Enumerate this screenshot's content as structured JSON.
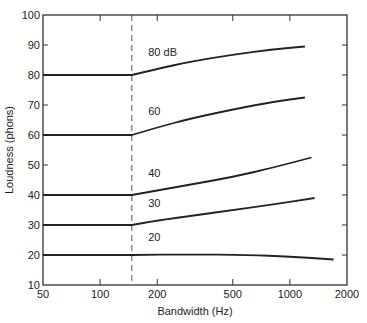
{
  "chart_data": {
    "type": "line",
    "title": "",
    "xlabel": "Bandwidth (Hz)",
    "ylabel": "Loudness (phons)",
    "xscale": "log",
    "xlim": [
      50,
      2000
    ],
    "ylim": [
      10,
      100
    ],
    "xticks": [
      50,
      100,
      200,
      500,
      1000,
      2000
    ],
    "xtick_labels": [
      "50",
      "100",
      "200",
      "500",
      "1000",
      "2000"
    ],
    "yticks": [
      10,
      20,
      30,
      40,
      50,
      60,
      70,
      80,
      90,
      100
    ],
    "ytick_labels": [
      "10",
      "20",
      "30",
      "40",
      "50",
      "60",
      "70",
      "80",
      "90",
      "100"
    ],
    "grid": false,
    "annotations": [
      {
        "type": "vline",
        "x": 160,
        "style": "dashed",
        "meaning": "critical bandwidth"
      }
    ],
    "series": [
      {
        "name": "80 dB",
        "label": "80 dB",
        "x": [
          50,
          160,
          200,
          300,
          500,
          800,
          1200
        ],
        "y": [
          80,
          80,
          82,
          84.5,
          86.8,
          88.5,
          89.5
        ]
      },
      {
        "name": "60 dB",
        "label": "60",
        "x": [
          50,
          160,
          200,
          300,
          500,
          800,
          1200
        ],
        "y": [
          60,
          60,
          62.5,
          65.5,
          68.5,
          71,
          72.5
        ]
      },
      {
        "name": "40 dB",
        "label": "40",
        "x": [
          50,
          160,
          200,
          300,
          500,
          800,
          1300
        ],
        "y": [
          40,
          40,
          41.5,
          43.5,
          46,
          49,
          52.5
        ]
      },
      {
        "name": "30 dB",
        "label": "30",
        "x": [
          50,
          160,
          200,
          300,
          500,
          800,
          1350
        ],
        "y": [
          30,
          30,
          31.5,
          33,
          35,
          36.8,
          39
        ]
      },
      {
        "name": "20 dB",
        "label": "20",
        "x": [
          50,
          160,
          300,
          600,
          1000,
          1700
        ],
        "y": [
          20,
          20,
          20.2,
          20,
          19.5,
          18.5
        ]
      }
    ]
  }
}
